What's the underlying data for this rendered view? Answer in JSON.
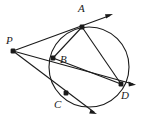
{
  "figure": {
    "type": "geometry-diagram",
    "background_color": "#ffffff",
    "stroke_color": "#1a1a1a",
    "point_color": "#1a1a1a",
    "labels": {
      "A": "A",
      "B": "B",
      "C": "C",
      "D": "D",
      "P": "P"
    },
    "circle": {
      "cx": 89,
      "cy": 67,
      "r": 40
    },
    "points": [
      {
        "id": "A",
        "x": 82,
        "y": 27
      },
      {
        "id": "B",
        "x": 53,
        "y": 58
      },
      {
        "id": "C",
        "x": 66,
        "y": 93
      },
      {
        "id": "D",
        "x": 121,
        "y": 84
      },
      {
        "id": "P",
        "x": 13,
        "y": 51
      }
    ],
    "rays": [
      {
        "id": "ray-P-A",
        "from": "P",
        "through": "A",
        "tip_x": 113,
        "tip_y": 14
      },
      {
        "id": "ray-P-B-D",
        "from": "P",
        "through": "D",
        "tip_x": 136,
        "tip_y": 84
      },
      {
        "id": "ray-P-C",
        "from": "P",
        "through": "C",
        "tip_x": 97,
        "tip_y": 114
      }
    ],
    "chords": [
      {
        "id": "chord-A-B",
        "from": "A",
        "to": "B"
      },
      {
        "id": "chord-A-D",
        "from": "A",
        "to": "D"
      },
      {
        "id": "chord-B-D",
        "from": "B",
        "to": "D"
      }
    ]
  }
}
